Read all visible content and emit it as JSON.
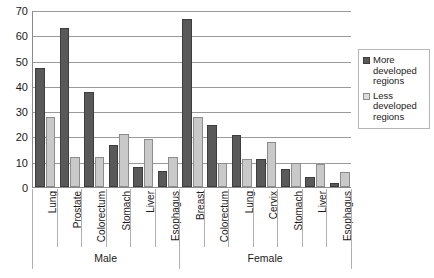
{
  "chart_data": {
    "type": "bar",
    "title": "",
    "xlabel": "",
    "ylabel": "",
    "ylim": [
      0,
      70
    ],
    "ytick_step": 10,
    "yticks": [
      70,
      60,
      50,
      40,
      30,
      20,
      10,
      0
    ],
    "grid": true,
    "legend_position": "right",
    "groups": [
      {
        "name": "Male",
        "categories": [
          "Lung",
          "Prostate",
          "Colorectum",
          "Stomach",
          "Liver",
          "Esophagus"
        ]
      },
      {
        "name": "Female",
        "categories": [
          "Breast",
          "Colorectum",
          "Lung",
          "Cervix",
          "Stomach",
          "Liver",
          "Esophagus"
        ]
      }
    ],
    "categories": [
      "Lung",
      "Prostate",
      "Colorectum",
      "Stomach",
      "Liver",
      "Esophagus",
      "Breast",
      "Colorectum",
      "Lung",
      "Cervix",
      "Stomach",
      "Liver",
      "Esophagus"
    ],
    "series": [
      {
        "name": "More developed regions",
        "color": "#595959",
        "values": [
          47,
          63,
          37.5,
          16.5,
          8,
          6.5,
          66.5,
          24.5,
          20.5,
          11,
          7,
          4,
          1.5
        ]
      },
      {
        "name": "Less developed regions",
        "color": "#c9c9c9",
        "values": [
          27.5,
          12,
          12,
          21,
          19,
          12,
          27.5,
          9.5,
          11,
          18,
          9.5,
          9,
          6
        ]
      }
    ]
  },
  "legend": {
    "entries": [
      {
        "label_line1": "More",
        "label_line2": "developed",
        "label_line3": "regions",
        "swatch": "more"
      },
      {
        "label_line1": "Less",
        "label_line2": "developed",
        "label_line3": "regions",
        "swatch": "less"
      }
    ],
    "more_label": "More developed regions",
    "less_label": "Less developed regions"
  }
}
